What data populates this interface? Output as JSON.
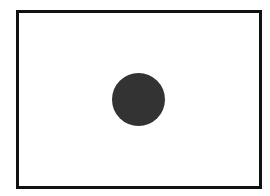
{
  "diagram": {
    "frame": {
      "shape": "rectangle",
      "border_color": "#111111",
      "fill_color": "#ffffff"
    },
    "dot": {
      "shape": "circle",
      "fill_color": "#333333"
    }
  }
}
